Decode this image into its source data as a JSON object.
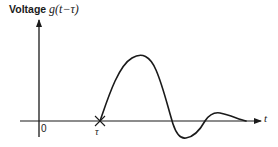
{
  "figure": {
    "y_axis_label_text": "Voltage ",
    "y_axis_label_math": "g(t−τ)",
    "x_axis_label": "t",
    "origin_label": "0",
    "tau_label": "τ",
    "colors": {
      "ink": "#1a1a1a",
      "background": "#ffffff"
    }
  },
  "diagram": {
    "type": "waveform-sketch",
    "features": [
      {
        "name": "start",
        "at": "t = τ",
        "value": 0
      },
      {
        "name": "main-peak",
        "sign": "positive"
      },
      {
        "name": "zero-crossing-1"
      },
      {
        "name": "undershoot",
        "sign": "negative"
      },
      {
        "name": "zero-crossing-2"
      },
      {
        "name": "ringing-peak",
        "sign": "positive",
        "relative": "small"
      },
      {
        "name": "decay",
        "toward": 0
      }
    ]
  }
}
